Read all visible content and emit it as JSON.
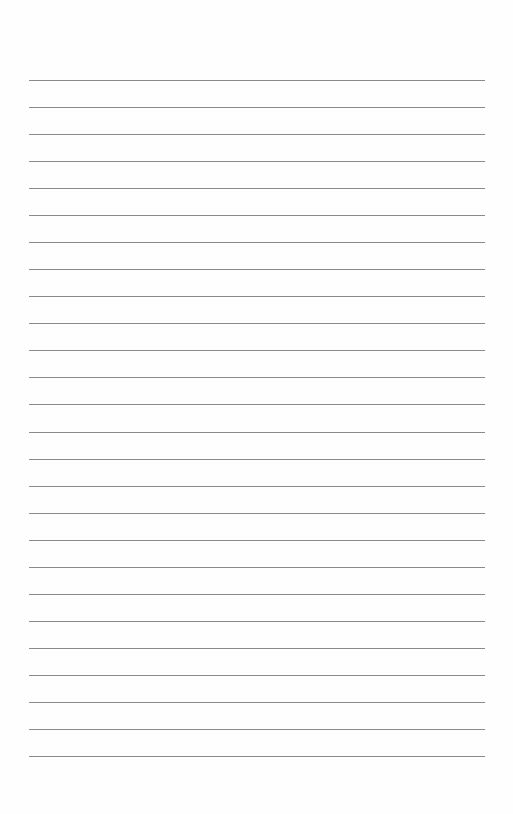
{
  "document": {
    "type": "lined-paper",
    "line_count": 26,
    "line_color": "#8a8a8a",
    "paper_color": "#fefefe",
    "text_content": []
  }
}
